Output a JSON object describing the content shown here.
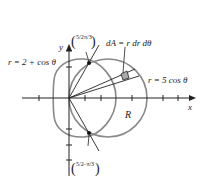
{
  "diagram": {
    "axes": {
      "x_label": "x",
      "y_label": "y"
    },
    "curves": {
      "limacon": "r = 2 + cos θ",
      "circle": "r = 5 cos θ"
    },
    "area_element": "dA = r dr dθ",
    "region_label": "R",
    "intersection_top": {
      "r": "5/2",
      "theta": "π/3"
    },
    "intersection_bottom": {
      "r": "5/2",
      "theta": "−π/3"
    },
    "colors": {
      "region_fill": "#d4d4d4",
      "curve": "#888888",
      "axis": "#222222"
    }
  }
}
